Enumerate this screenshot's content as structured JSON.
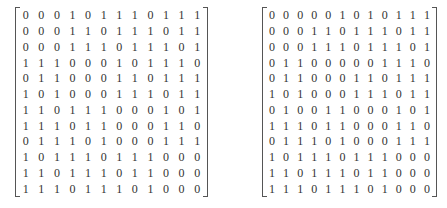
{
  "matrices": [
    {
      "name": "left",
      "rows": [
        [
          0,
          0,
          0,
          1,
          0,
          1,
          1,
          1,
          0,
          1,
          1,
          1
        ],
        [
          0,
          0,
          0,
          1,
          1,
          0,
          1,
          1,
          1,
          0,
          1,
          1
        ],
        [
          0,
          0,
          0,
          1,
          1,
          1,
          0,
          1,
          1,
          1,
          0,
          1
        ],
        [
          1,
          1,
          1,
          0,
          0,
          0,
          1,
          0,
          1,
          1,
          1,
          0
        ],
        [
          0,
          1,
          1,
          0,
          0,
          0,
          1,
          1,
          0,
          1,
          1,
          1
        ],
        [
          1,
          0,
          1,
          0,
          0,
          0,
          1,
          1,
          1,
          0,
          1,
          1
        ],
        [
          1,
          1,
          0,
          1,
          1,
          1,
          0,
          0,
          0,
          1,
          0,
          1
        ],
        [
          1,
          1,
          1,
          0,
          1,
          1,
          0,
          0,
          0,
          1,
          1,
          0
        ],
        [
          0,
          1,
          1,
          1,
          0,
          1,
          0,
          0,
          0,
          1,
          1,
          1
        ],
        [
          1,
          0,
          1,
          1,
          1,
          0,
          1,
          1,
          1,
          0,
          0,
          0
        ],
        [
          1,
          1,
          0,
          1,
          1,
          1,
          0,
          1,
          1,
          0,
          0,
          0
        ],
        [
          1,
          1,
          1,
          0,
          1,
          1,
          1,
          0,
          1,
          0,
          0,
          0
        ]
      ]
    },
    {
      "name": "right",
      "rows": [
        [
          0,
          0,
          0,
          0,
          0,
          1,
          0,
          1,
          0,
          1,
          1,
          1
        ],
        [
          0,
          0,
          0,
          1,
          1,
          0,
          1,
          1,
          1,
          0,
          1,
          1
        ],
        [
          0,
          0,
          0,
          1,
          1,
          1,
          0,
          1,
          1,
          1,
          0,
          1
        ],
        [
          0,
          1,
          1,
          0,
          0,
          0,
          0,
          0,
          1,
          1,
          1,
          0
        ],
        [
          0,
          1,
          1,
          0,
          0,
          0,
          1,
          1,
          0,
          1,
          1,
          1
        ],
        [
          1,
          0,
          1,
          0,
          0,
          0,
          1,
          1,
          1,
          0,
          1,
          1
        ],
        [
          0,
          1,
          0,
          0,
          1,
          1,
          0,
          0,
          0,
          1,
          0,
          1
        ],
        [
          1,
          1,
          1,
          0,
          1,
          1,
          0,
          0,
          0,
          1,
          1,
          0
        ],
        [
          0,
          1,
          1,
          1,
          0,
          1,
          0,
          0,
          0,
          1,
          1,
          1
        ],
        [
          1,
          0,
          1,
          1,
          1,
          0,
          1,
          1,
          1,
          0,
          0,
          0
        ],
        [
          1,
          1,
          0,
          1,
          1,
          1,
          0,
          1,
          1,
          0,
          0,
          0
        ],
        [
          1,
          1,
          1,
          0,
          1,
          1,
          1,
          0,
          1,
          0,
          0,
          0
        ]
      ]
    }
  ]
}
